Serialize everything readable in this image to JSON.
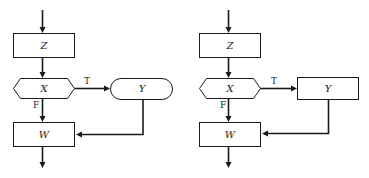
{
  "diagrams": [
    {
      "id": "left",
      "nodes": {
        "z": {
          "label": "Z",
          "shape": "rectangle"
        },
        "x": {
          "label": "X",
          "shape": "hexagon-decision"
        },
        "y": {
          "label": "Y",
          "shape": "rounded-terminal"
        },
        "w": {
          "label": "W",
          "shape": "rectangle"
        }
      },
      "edges": {
        "true_label": "T",
        "false_label": "F"
      }
    },
    {
      "id": "right",
      "nodes": {
        "z": {
          "label": "Z",
          "shape": "rectangle"
        },
        "x": {
          "label": "X",
          "shape": "hexagon-decision"
        },
        "y": {
          "label": "Y",
          "shape": "rectangle"
        },
        "w": {
          "label": "W",
          "shape": "rectangle"
        }
      },
      "edges": {
        "true_label": "T",
        "false_label": "F"
      }
    }
  ],
  "colors": {
    "stroke": "#1a1a1a",
    "background": "#ffffff"
  }
}
